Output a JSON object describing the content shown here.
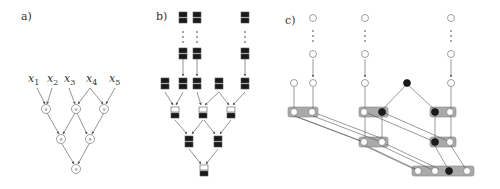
{
  "panels": {
    "a": {
      "label": "a)",
      "inputs": [
        "x",
        "x",
        "x",
        "x",
        "x"
      ],
      "input_subs": [
        "1",
        "2",
        "3",
        "4",
        "5"
      ],
      "layer1_ops": [
        "∨",
        "∨",
        "∨"
      ],
      "layer2_ops": [
        "∧",
        "∧"
      ],
      "layer3_ops": [
        "∨"
      ]
    },
    "b": {
      "label": "b)"
    },
    "c": {
      "label": "c)"
    }
  },
  "colors": {
    "line": "#555555",
    "node_fill_dark": "#1a1a1a",
    "group_fill": "#aaaaaa",
    "node_outline": "#777777"
  }
}
